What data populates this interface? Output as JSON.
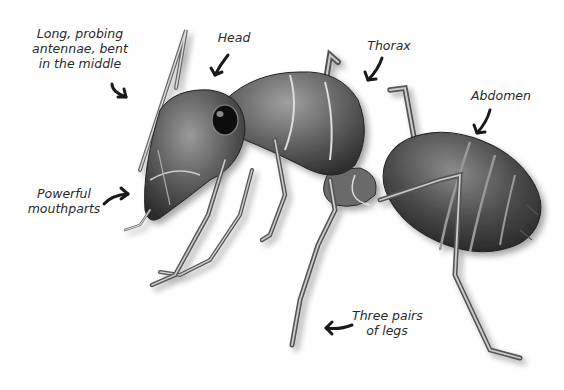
{
  "diagram": {
    "labels": [
      {
        "id": "antennae",
        "lines": [
          "Long, probing",
          "antennae, bent",
          "in the middle"
        ]
      },
      {
        "id": "head",
        "lines": [
          "Head"
        ]
      },
      {
        "id": "thorax",
        "lines": [
          "Thorax"
        ]
      },
      {
        "id": "abdomen",
        "lines": [
          "Abdomen"
        ]
      },
      {
        "id": "mouthparts",
        "lines": [
          "Powerful",
          "mouthparts"
        ]
      },
      {
        "id": "legs",
        "lines": [
          "Three pairs",
          "of legs"
        ]
      }
    ],
    "colors": {
      "background": "#ffffff",
      "label_text": "#2a2a2a",
      "arrow": "#1a1a1a",
      "body_dark": "#3a3a3a",
      "body_mid": "#6e6e6e",
      "body_light": "#b8b8b8"
    }
  }
}
